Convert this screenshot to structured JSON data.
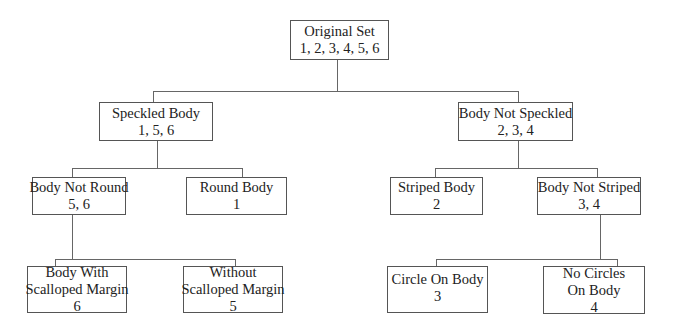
{
  "nodes": {
    "root": {
      "label": "Original Set",
      "items": "1, 2, 3, 4, 5, 6"
    },
    "speckled": {
      "label": "Speckled Body",
      "items": "1, 5, 6"
    },
    "not_speckled": {
      "label": "Body Not Speckled",
      "items": "2, 3, 4"
    },
    "not_round": {
      "label": "Body Not Round",
      "items": "5, 6"
    },
    "round": {
      "label": "Round Body",
      "items": "1"
    },
    "striped": {
      "label": "Striped Body",
      "items": "2"
    },
    "not_striped": {
      "label": "Body Not Striped",
      "items": "3, 4"
    },
    "scalloped": {
      "label1": "Body With",
      "label2": "Scalloped Margin",
      "items": "6"
    },
    "no_scalloped": {
      "label1": "Without",
      "label2": "Scalloped Margin",
      "items": "5"
    },
    "circle": {
      "label": "Circle On Body",
      "items": "3"
    },
    "no_circles": {
      "label1": "No Circles",
      "label2": "On Body",
      "items": "4"
    }
  }
}
